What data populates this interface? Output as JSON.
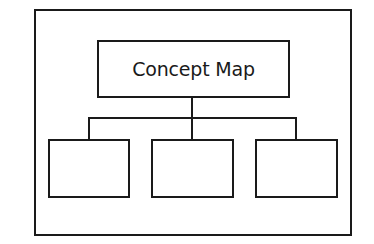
{
  "diagram": {
    "type": "concept-map",
    "root": {
      "label": "Concept Map"
    },
    "children": [
      {
        "label": ""
      },
      {
        "label": ""
      },
      {
        "label": ""
      }
    ],
    "colors": {
      "stroke": "#1a1a1a",
      "background": "#ffffff"
    }
  }
}
